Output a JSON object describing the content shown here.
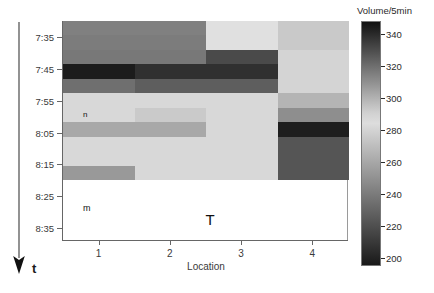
{
  "figure": {
    "background_color": "#ffffff",
    "axis_color": "#666666"
  },
  "time_axis": {
    "arrow_name": "time-direction-arrow",
    "arrow_label": "t"
  },
  "annotations": [
    {
      "text": "n",
      "x_pct": 7.0,
      "y_pct": 41.0,
      "size": "small"
    },
    {
      "text": "m",
      "x_pct": 7.0,
      "y_pct": 83.5,
      "size": "medium"
    },
    {
      "text": "T",
      "x_pct": 50.0,
      "y_pct": 87.0,
      "size": "large"
    }
  ],
  "colorbar": {
    "title": "Volume/5min",
    "ticks": [
      340,
      320,
      300,
      280,
      260,
      240,
      220,
      200
    ],
    "tick_labels": [
      "340",
      "320",
      "300",
      "280",
      "260",
      "240",
      "220",
      "200"
    ],
    "min": 195,
    "max": 348
  },
  "chart_data": {
    "type": "heatmap",
    "title": "",
    "xlabel": "Location",
    "ylabel": "",
    "colorbar_label": "Volume/5min",
    "grid": false,
    "legend_position": "right-colorbar",
    "x_categories": [
      "1",
      "2",
      "3",
      "4"
    ],
    "x_tick_labels": [
      "1",
      "2",
      "3",
      "4"
    ],
    "y_tick_labels": [
      "7:35",
      "7:45",
      "7:55",
      "8:05",
      "8:15",
      "8:25",
      "8:35"
    ],
    "y_tick_positions_pct": [
      7.5,
      22.0,
      36.5,
      51.0,
      65.5,
      80.0,
      94.5
    ],
    "y_rows": [
      "7:30",
      "7:35",
      "7:40",
      "7:45",
      "7:50",
      "7:55",
      "8:00",
      "8:05",
      "8:10",
      "8:15",
      "8:20"
    ],
    "zlim": [
      195,
      348
    ],
    "values": [
      [
        252,
        252,
        288,
        276
      ],
      [
        248,
        248,
        288,
        276
      ],
      [
        245,
        245,
        222,
        281
      ],
      [
        340,
        332,
        332,
        281
      ],
      [
        252,
        240,
        240,
        281
      ],
      [
        281,
        281,
        281,
        262
      ],
      [
        281,
        274,
        281,
        244
      ],
      [
        256,
        256,
        281,
        344
      ],
      [
        281,
        281,
        281,
        226
      ],
      [
        281,
        281,
        281,
        226
      ],
      [
        253,
        281,
        281,
        226
      ]
    ],
    "cell_colors": [
      [
        "#808080",
        "#808080",
        "#e0e0e0",
        "#c9c9c9"
      ],
      [
        "#7c7c7c",
        "#7c7c7c",
        "#e0e0e0",
        "#c9c9c9"
      ],
      [
        "#787878",
        "#787878",
        "#4a4a4a",
        "#d4d4d4"
      ],
      [
        "#1c1c1c",
        "#303030",
        "#303030",
        "#d4d4d4"
      ],
      [
        "#6f6f6f",
        "#5e5e5e",
        "#5e5e5e",
        "#d4d4d4"
      ],
      [
        "#d8d8d8",
        "#d8d8d8",
        "#d8d8d8",
        "#b4b4b4"
      ],
      [
        "#d8d8d8",
        "#cacaca",
        "#d8d8d8",
        "#8e8e8e"
      ],
      [
        "#a8a8a8",
        "#a8a8a8",
        "#d8d8d8",
        "#1e1e1e"
      ],
      [
        "#d8d8d8",
        "#d8d8d8",
        "#d8d8d8",
        "#555555"
      ],
      [
        "#d8d8d8",
        "#d8d8d8",
        "#d8d8d8",
        "#555555"
      ],
      [
        "#999999",
        "#d8d8d8",
        "#d8d8d8",
        "#555555"
      ]
    ],
    "blank_region_note": "no data below 8:15"
  }
}
